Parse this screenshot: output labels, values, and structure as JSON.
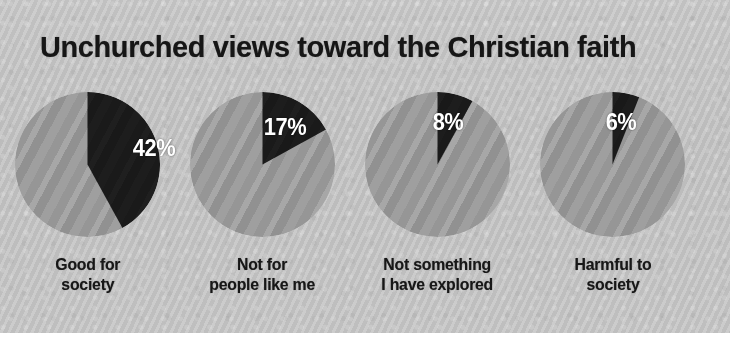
{
  "title": "Unchurched views toward the Christian faith",
  "colors": {
    "panel_background": "#c8c8c8",
    "slice_dark": "#1b1b1b",
    "slice_light": "#9a9a9a",
    "title_text": "#161616",
    "value_text": "#ffffff"
  },
  "chart_data": {
    "type": "pie",
    "title": "Unchurched views toward the Christian faith",
    "xlabel": "",
    "ylabel": "",
    "legend": "none",
    "grid": false,
    "note": "Four separate single-value pie charts; each dark wedge begins at 12 o'clock and sweeps clockwise.",
    "categories": [
      "Good for society",
      "Not for people like me",
      "Not something I have explored",
      "Harmful to society"
    ],
    "values": [
      42,
      17,
      8,
      6
    ],
    "value_labels": [
      "42%",
      "17%",
      "8%",
      "6%"
    ],
    "series": [
      {
        "name": "Agree",
        "values": [
          42,
          17,
          8,
          6
        ]
      },
      {
        "name": "Remainder",
        "values": [
          58,
          83,
          92,
          94
        ]
      }
    ],
    "pies": [
      {
        "label_line1": "Good for",
        "label_line2": "society",
        "value": 42,
        "value_label": "42%",
        "remainder": 58
      },
      {
        "label_line1": "Not for",
        "label_line2": "people like me",
        "value": 17,
        "value_label": "17%",
        "remainder": 83
      },
      {
        "label_line1": "Not something",
        "label_line2": "I have explored",
        "value": 8,
        "value_label": "8%",
        "remainder": 92
      },
      {
        "label_line1": "Harmful to",
        "label_line2": "society",
        "value": 6,
        "value_label": "6%",
        "remainder": 94
      }
    ]
  }
}
